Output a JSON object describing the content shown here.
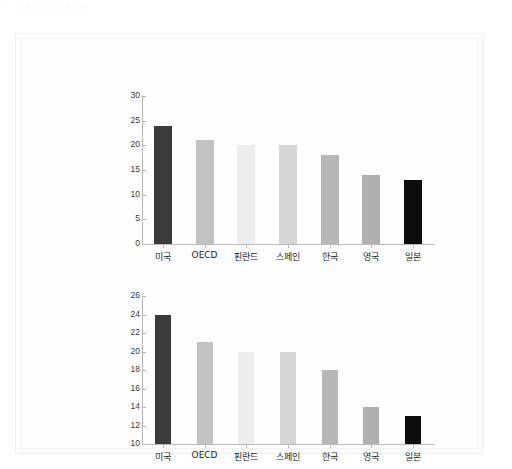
{
  "top_strip": {
    "text": "▫ ▫▫▫ ▫▫  ▫▫▫▫  ▫▫▫"
  },
  "chart_data": [
    {
      "id": "chart-1",
      "type": "bar",
      "title": "",
      "subtitle": "",
      "xlabel": "",
      "ylabel": "",
      "categories": [
        "미국",
        "OECD",
        "핀란드",
        "스페인",
        "한국",
        "영국",
        "일본"
      ],
      "values": [
        24,
        21,
        20,
        20,
        18,
        14,
        13
      ],
      "colors": [
        "#3b3b3b",
        "#c2c2c2",
        "#ededed",
        "#d6d6d6",
        "#b7b7b7",
        "#b0b0b0",
        "#0d0d0d"
      ],
      "ylim": [
        0,
        30
      ],
      "yticks": [
        0,
        5,
        10,
        15,
        20,
        25,
        30
      ],
      "ytick_labels": [
        "0",
        "5",
        "10",
        "15",
        "20",
        "25",
        "30"
      ],
      "grid": false,
      "legend": "none",
      "bar_width_px": 18
    },
    {
      "id": "chart-2",
      "type": "bar",
      "title": "",
      "subtitle": "",
      "xlabel": "",
      "ylabel": "",
      "categories": [
        "미국",
        "OECD",
        "핀란드",
        "스페인",
        "한국",
        "영국",
        "일본"
      ],
      "values": [
        24,
        21,
        20,
        20,
        18,
        14,
        13
      ],
      "colors": [
        "#3b3b3b",
        "#c2c2c2",
        "#ededed",
        "#d6d6d6",
        "#b7b7b7",
        "#b0b0b0",
        "#0d0d0d"
      ],
      "ylim": [
        10,
        26
      ],
      "yticks": [
        10,
        12,
        14,
        16,
        18,
        20,
        22,
        24,
        26
      ],
      "ytick_labels": [
        "10",
        "12",
        "14",
        "16",
        "18",
        "20",
        "22",
        "24",
        "26"
      ],
      "grid": false,
      "legend": "none",
      "bar_width_px": 16
    }
  ]
}
